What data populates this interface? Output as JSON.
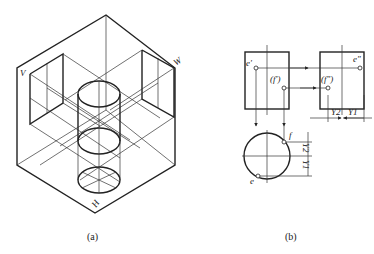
{
  "figure_a": {
    "caption": "(a)",
    "plane_labels": {
      "v": "V",
      "w": "W",
      "h": "H"
    }
  },
  "figure_b": {
    "caption": "(b)",
    "point_labels": {
      "e_front": "e'",
      "f_front": "(f')",
      "e_side": "e\"",
      "f_side": "(f\")",
      "f_top": "f",
      "e_top": "e"
    },
    "dimensions": {
      "y1": "Y1",
      "y2": "Y2"
    }
  }
}
